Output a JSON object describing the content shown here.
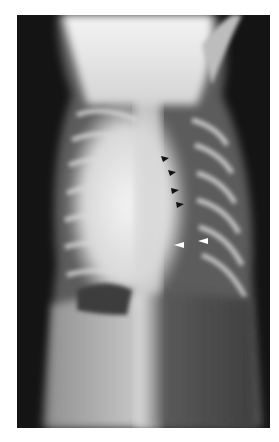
{
  "figure": {
    "type": "radiograph",
    "view": "ventrodorsal thorax",
    "background_color": "#ffffff",
    "film_color": "#141414",
    "annotations": {
      "black_arrowheads": [
        {
          "x": 148,
          "y": 143
        },
        {
          "x": 155,
          "y": 157
        },
        {
          "x": 158,
          "y": 175
        },
        {
          "x": 163,
          "y": 189
        }
      ],
      "white_arrowheads": [
        {
          "x": 162,
          "y": 230
        },
        {
          "x": 186,
          "y": 226
        }
      ]
    }
  }
}
